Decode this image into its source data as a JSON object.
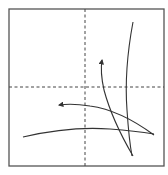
{
  "diagram": {
    "type": "fold-diagram",
    "colors": {
      "background": "#ffffff",
      "frame": "#555555",
      "crease": "#444444",
      "stroke": "#333333"
    },
    "frame": {
      "x": 9,
      "y": 9,
      "width": 155,
      "height": 157
    },
    "creases": [
      {
        "name": "vertical-center-crease",
        "style": "dashed",
        "x1": 85,
        "y1": 9,
        "x2": 85,
        "y2": 166
      },
      {
        "name": "horizontal-center-crease",
        "style": "dashed",
        "x1": 9,
        "y1": 87,
        "x2": 164,
        "y2": 87
      }
    ],
    "curves": [
      {
        "name": "tall-vertical-curve",
        "arrow": false,
        "d": "M133 22 Q124 70 127 110 Q129 140 132 156"
      },
      {
        "name": "upward-arrow-curve",
        "arrow": true,
        "d": "M133 156 Q112 120 104 90 Q100 72 102 60"
      },
      {
        "name": "leftward-arrow-curve",
        "arrow": true,
        "d": "M154 135 Q120 110 90 106 Q72 103 59 105"
      },
      {
        "name": "bottom-horizontal-curve",
        "arrow": false,
        "d": "M23 137 Q70 126 110 129 Q135 131 154 134"
      }
    ]
  }
}
